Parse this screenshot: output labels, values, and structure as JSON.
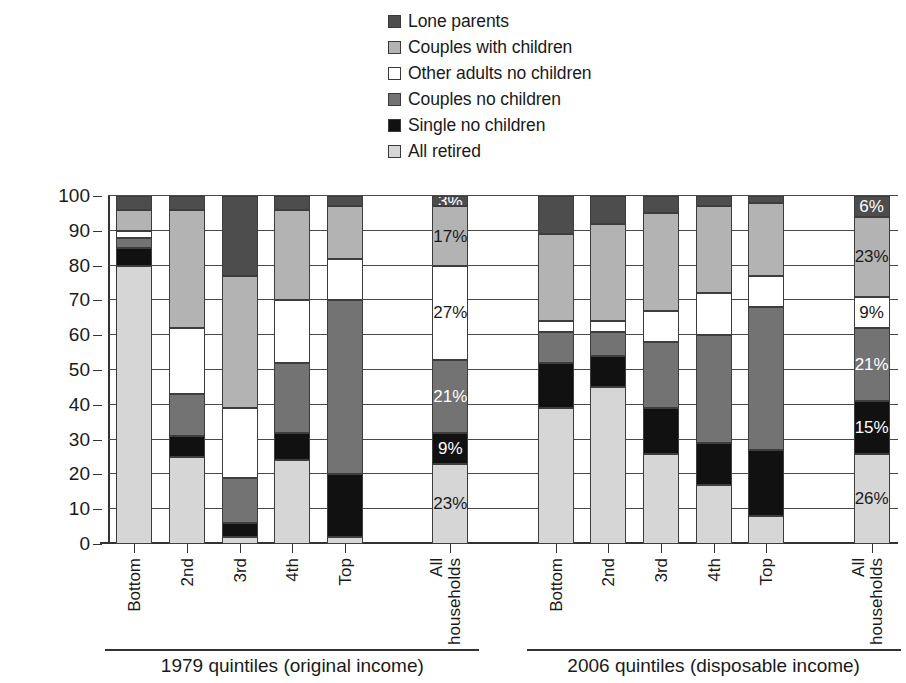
{
  "chart_data": {
    "type": "bar",
    "subtype": "stacked-column-100",
    "title": "",
    "xlabel": "",
    "ylabel": "Percentage of population",
    "ylim": [
      0,
      100
    ],
    "ytick_values": [
      0,
      10,
      20,
      30,
      40,
      50,
      60,
      70,
      80,
      90,
      100
    ],
    "grid": true,
    "legend_position": "top-center",
    "legend_reversed": true,
    "series": [
      {
        "name": "Lone parents",
        "color": "#4d4d4d"
      },
      {
        "name": "Couples with children",
        "color": "#b3b3b3"
      },
      {
        "name": "Other adults no children",
        "color": "#ffffff"
      },
      {
        "name": "Couples no children",
        "color": "#737373"
      },
      {
        "name": "Single no children",
        "color": "#111111"
      },
      {
        "name": "All retired",
        "color": "#d6d6d6"
      }
    ],
    "groups": [
      {
        "title": "1979 quintiles (original income)",
        "categories": [
          "Bottom",
          "2nd",
          "3rd",
          "4th",
          "Top",
          "All households"
        ],
        "values": {
          "All retired": [
            80,
            25,
            2,
            24,
            2,
            23
          ],
          "Single no children": [
            5,
            6,
            4,
            8,
            18,
            9
          ],
          "Couples no children": [
            3,
            12,
            13,
            20,
            50,
            21
          ],
          "Other adults no children": [
            2,
            19,
            20,
            18,
            12,
            27
          ],
          "Couples with children": [
            6,
            34,
            38,
            26,
            15,
            17
          ],
          "Lone parents": [
            4,
            4,
            23,
            4,
            3,
            3
          ]
        }
      },
      {
        "title": "2006 quintiles (disposable income)",
        "categories": [
          "Bottom",
          "2nd",
          "3rd",
          "4th",
          "Top",
          "All households"
        ],
        "values": {
          "All retired": [
            39,
            45,
            26,
            17,
            8,
            26
          ],
          "Single no children": [
            13,
            9,
            13,
            12,
            19,
            15
          ],
          "Couples no children": [
            9,
            7,
            19,
            31,
            41,
            21
          ],
          "Other adults no children": [
            3,
            3,
            9,
            12,
            9,
            9
          ],
          "Couples with children": [
            25,
            28,
            28,
            25,
            21,
            23
          ],
          "Lone parents": [
            11,
            8,
            5,
            3,
            2,
            6
          ]
        }
      }
    ],
    "data_labels": {
      "1979 quintiles (original income)": {
        "All households": {
          "All retired": "23%",
          "Single no children": "9%",
          "Couples no children": "21%",
          "Other adults no children": "27%",
          "Couples with children": "17%",
          "Lone parents": "3%"
        }
      },
      "2006 quintiles (disposable income)": {
        "All households": {
          "All retired": "26%",
          "Single no children": "15%",
          "Couples no children": "21%",
          "Other adults no children": "9%",
          "Couples with children": "23%",
          "Lone parents": "6%"
        }
      }
    }
  },
  "legend": {
    "items": [
      {
        "label": "Lone parents",
        "color": "#4d4d4d"
      },
      {
        "label": "Couples with children",
        "color": "#b3b3b3"
      },
      {
        "label": "Other adults no children",
        "color": "#ffffff"
      },
      {
        "label": "Couples no children",
        "color": "#737373"
      },
      {
        "label": "Single no children",
        "color": "#111111"
      },
      {
        "label": "All retired",
        "color": "#d6d6d6"
      }
    ]
  },
  "axes": {
    "y_title": "Percentage of population",
    "y_ticks": [
      "100",
      "90",
      "80",
      "70",
      "60",
      "50",
      "40",
      "30",
      "20",
      "10",
      "0"
    ]
  }
}
